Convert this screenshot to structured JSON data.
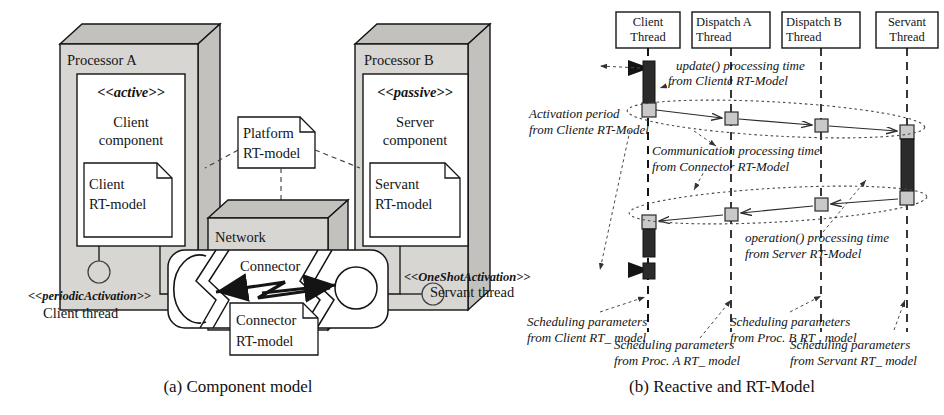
{
  "figure": {
    "caption_a": "(a) Component model",
    "caption_b": "(b) Reactive and RT-Model"
  },
  "colors": {
    "stroke": "#141414",
    "node_face": "#d8d6d2",
    "node_top": "#c3c1bd",
    "white": "#ffffff",
    "activation_dark": "#2b2b2b",
    "marker_gray": "#c9c9c9",
    "dashed": "#4a4a4a"
  },
  "component_model": {
    "processor_a": {
      "title": "Processor A",
      "component": {
        "stereotype": "<<active>>",
        "name_line1": "Client",
        "name_line2": "component",
        "note_line1": "Client",
        "note_line2": "RT-model"
      },
      "port_stereotype": "<<periodicActivation>>",
      "port_label": "Client thread"
    },
    "processor_b": {
      "title": "Processor B",
      "component": {
        "stereotype": "<<passive>>",
        "name_line1": "Server",
        "name_line2": "component",
        "note_line1": "Servant",
        "note_line2": "RT-model"
      },
      "port_stereotype": "<<OneShotActivation>>",
      "port_label": "Servant thread"
    },
    "platform_note": {
      "line1": "Platform",
      "line2": "RT-model"
    },
    "network": {
      "title": "Network",
      "connector_label": "Connector",
      "connector_note_line1": "Connector",
      "connector_note_line2": "RT-model"
    }
  },
  "sequence_model": {
    "lifelines": [
      {
        "id": "client",
        "line1": "Client",
        "line2": "Thread",
        "x": 648
      },
      {
        "id": "dispatch_a",
        "line1": "Dispatch A",
        "line2": "Thread",
        "x": 740
      },
      {
        "id": "dispatch_b",
        "line1": "Dispatch B",
        "line2": "Thread",
        "x": 828
      },
      {
        "id": "servant",
        "line1": "Servant",
        "line2": "Thread",
        "x": 908
      }
    ],
    "annotations": [
      {
        "id": "update-time",
        "line1": "update() processing time",
        "line2": "from Cliente RT-Model",
        "x": 676,
        "y": 70
      },
      {
        "id": "activation-period",
        "line1": "Activation period",
        "line2": "from Cliente RT-Model",
        "x": 529,
        "y": 118
      },
      {
        "id": "communication-time",
        "line1": "Communication processing time",
        "line2": "from Connector RT-Model",
        "x": 652,
        "y": 153
      },
      {
        "id": "operation-time",
        "line1": "operation() processing time",
        "line2": "from Server RT-Model",
        "x": 745,
        "y": 240
      },
      {
        "id": "sched-client",
        "line1": "Scheduling parameters",
        "line2": "from Client RT_ model",
        "x": 527,
        "y": 324
      },
      {
        "id": "sched-proc-a",
        "line1": "Scheduling parameters",
        "line2": "from Proc. A RT_ model",
        "x": 600,
        "y": 347
      },
      {
        "id": "sched-proc-b",
        "line1": "Scheduling parameters",
        "line2": "from Proc. B RT_ model",
        "x": 722,
        "y": 324
      },
      {
        "id": "sched-servant",
        "line1": "Scheduling parameters",
        "line2": "from Servant RT_ model",
        "x": 778,
        "y": 347
      }
    ]
  }
}
